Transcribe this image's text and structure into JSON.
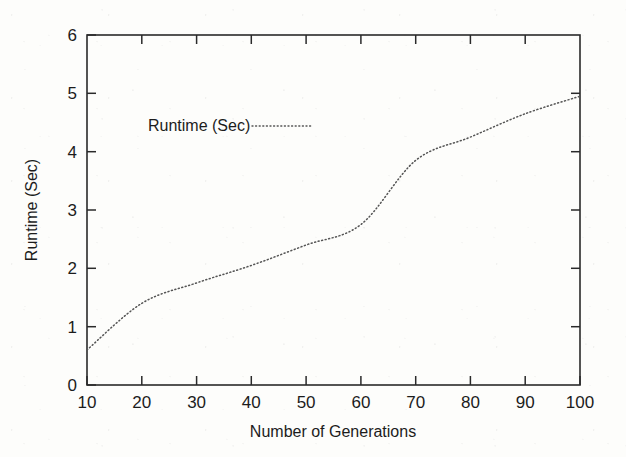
{
  "chart_data": {
    "type": "line",
    "title": "",
    "xlabel": "Number of Generations",
    "ylabel": "Runtime (Sec)",
    "xlim": [
      10,
      100
    ],
    "ylim": [
      0,
      6
    ],
    "xticks": [
      10,
      20,
      30,
      40,
      50,
      60,
      70,
      80,
      90,
      100
    ],
    "yticks": [
      0,
      1,
      2,
      3,
      4,
      5,
      6
    ],
    "xtick_labels": [
      "10",
      "20",
      "30",
      "40",
      "50",
      "60",
      "70",
      "80",
      "90",
      "100"
    ],
    "ytick_labels": [
      "0",
      "1",
      "2",
      "3",
      "4",
      "5",
      "6"
    ],
    "grid": false,
    "legend_position": "upper-left-inside",
    "legend": [
      "Runtime (Sec)"
    ],
    "line_style": "dotted",
    "line_color": "#555555",
    "x": [
      10,
      20,
      30,
      40,
      50,
      60,
      70,
      80,
      90,
      100
    ],
    "series": [
      {
        "name": "Runtime (Sec)",
        "values": [
          0.6,
          1.4,
          1.75,
          2.05,
          2.4,
          2.75,
          3.85,
          4.25,
          4.65,
          4.95
        ]
      }
    ]
  },
  "axes": {
    "x_title": "Number of Generations",
    "y_title": "Runtime (Sec)",
    "x_tick_labels": [
      "10",
      "20",
      "30",
      "40",
      "50",
      "60",
      "70",
      "80",
      "90",
      "100"
    ],
    "y_tick_labels": [
      "0",
      "1",
      "2",
      "3",
      "4",
      "5",
      "6"
    ]
  },
  "legend": {
    "entries": [
      {
        "label": "Runtime (Sec)",
        "style": "dotted",
        "color": "#555555"
      }
    ]
  },
  "colors": {
    "background": "#fdfdfb",
    "frame": "#2a2a2a",
    "text": "#1c1c1c",
    "series": "#555555"
  }
}
